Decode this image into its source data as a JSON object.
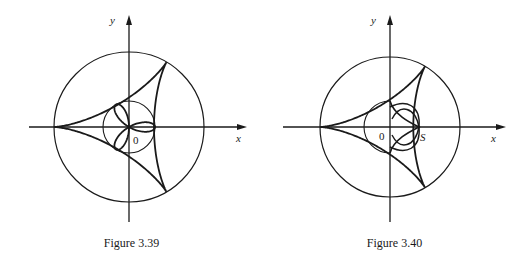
{
  "figures": [
    {
      "caption": "Figure 3.39",
      "labels": {
        "x_axis": "x",
        "y_axis": "y",
        "origin": "0"
      },
      "geometry": {
        "origin": [
          129,
          127
        ],
        "big_circle_r": 75,
        "small_circle_r": 26,
        "deltoid_a": 25,
        "x_axis": [
          29,
          247
        ],
        "y_axis": [
          15,
          222
        ],
        "curve": "trifolium",
        "curve_size": 26
      }
    },
    {
      "caption": "Figure 3.40",
      "labels": {
        "x_axis": "x",
        "y_axis": "y",
        "origin": "0",
        "point_s": "S"
      },
      "geometry": {
        "origin": [
          127,
          127
        ],
        "big_circle_r": 70,
        "small_circle_r": 0,
        "deltoid_a": 23.3,
        "x_axis": [
          20,
          243
        ],
        "y_axis": [
          15,
          222
        ],
        "curve": "pedal",
        "curve_size": 26
      }
    }
  ]
}
